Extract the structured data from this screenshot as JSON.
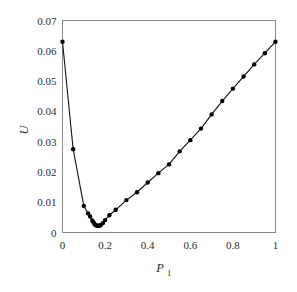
{
  "chart_data": {
    "type": "line",
    "title": "",
    "subtitle": "",
    "xlabel": "P",
    "xlabel_sub": "1",
    "ylabel": "U",
    "ylabel_sub": "",
    "xlim": [
      0,
      1
    ],
    "ylim": [
      0,
      0.07
    ],
    "grid": false,
    "legend": null,
    "legend_position": "none",
    "xticks": [
      0,
      0.2,
      0.4,
      0.6,
      0.8,
      1
    ],
    "xtick_labels": [
      "0",
      "0.2",
      "0.4",
      "0.6",
      "0.8",
      "1"
    ],
    "yticks": [
      0,
      0.01,
      0.02,
      0.03,
      0.04,
      0.05,
      0.06,
      0.07
    ],
    "ytick_labels": [
      "0",
      "0.01",
      "0.02",
      "0.03",
      "0.04",
      "0.05",
      "0.06",
      "0.07"
    ],
    "marker": "filled-circle",
    "marker_color": "#000000",
    "line_color": "#111111",
    "frame_color": "#8a8a8a",
    "background_color": "#ffffff",
    "series": [
      {
        "name": "U",
        "x": [
          0.0,
          0.05,
          0.1,
          0.12,
          0.13,
          0.14,
          0.145,
          0.15,
          0.155,
          0.16,
          0.165,
          0.17,
          0.175,
          0.18,
          0.19,
          0.2,
          0.22,
          0.25,
          0.3,
          0.35,
          0.4,
          0.45,
          0.5,
          0.55,
          0.6,
          0.65,
          0.7,
          0.75,
          0.8,
          0.85,
          0.9,
          0.95,
          1.0
        ],
        "y": [
          0.063,
          0.0275,
          0.0088,
          0.0063,
          0.0053,
          0.004,
          0.0034,
          0.0028,
          0.0025,
          0.0023,
          0.0022,
          0.0022,
          0.0023,
          0.0025,
          0.0031,
          0.0041,
          0.0057,
          0.0075,
          0.0107,
          0.0133,
          0.0165,
          0.0196,
          0.0225,
          0.0268,
          0.0305,
          0.0343,
          0.039,
          0.0434,
          0.0475,
          0.0515,
          0.0555,
          0.0592,
          0.063
        ]
      }
    ]
  }
}
